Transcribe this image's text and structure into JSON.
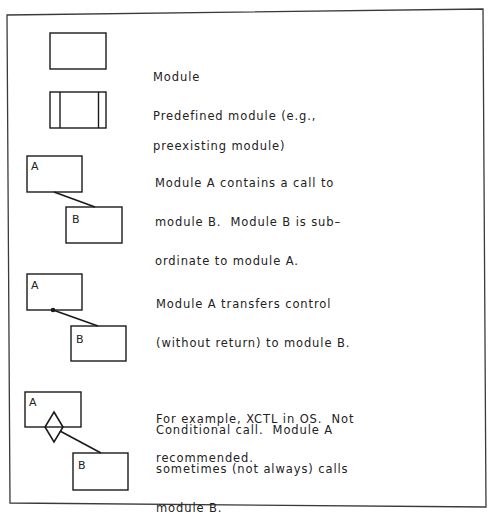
{
  "legend": {
    "items": [
      {
        "symbol": "module",
        "description": [
          "Module"
        ]
      },
      {
        "symbol": "predefined-module",
        "description": [
          "Predefined module (e.g.,",
          "preexisting module)"
        ]
      },
      {
        "symbol": "call",
        "box_a_label": "A",
        "box_b_label": "B",
        "description": [
          "Module A contains a call to",
          "module B.  Module B is sub–",
          "ordinate to module A."
        ]
      },
      {
        "symbol": "transfer-control",
        "box_a_label": "A",
        "box_b_label": "B",
        "description": [
          "Module A transfers control",
          "(without return) to module B."
        ],
        "note": [
          "For example, XCTL in OS.  Not",
          "recommended."
        ]
      },
      {
        "symbol": "conditional-call",
        "box_a_label": "A",
        "box_b_label": "B",
        "description": [
          "Conditional call.  Module A",
          "sometimes (not always) calls",
          "module B."
        ]
      }
    ]
  },
  "colors": {
    "line": "#1a1a1a",
    "frame": "#3a3a3a",
    "background": "#ffffff"
  }
}
